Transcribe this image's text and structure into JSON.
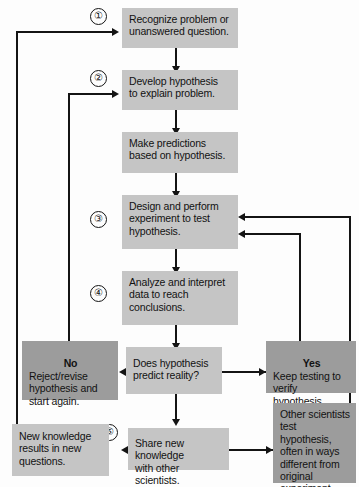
{
  "figure": {
    "kind": "flowchart",
    "colors": {
      "box_light": "#c5c5c5",
      "box_dark": "#9c9c9c",
      "line": "#141414",
      "text": "#121212",
      "background": "#fdfdfd"
    }
  },
  "steps": {
    "one": "①",
    "two": "②",
    "three": "③",
    "four": "④",
    "five": "⑤"
  },
  "nodes": {
    "recognize": "Recognize problem or\nunanswered question.",
    "hypothesis": "Develop hypothesis\nto explain problem.",
    "predictions": "Make predictions\nbased on hypothesis.",
    "experiment": "Design and perform\nexperiment to test\nhypothesis.",
    "analyze": "Analyze and interpret\ndata to reach\nconclusions.",
    "decision": "Does hypothesis\npredict reality?",
    "no_header": "No",
    "no_body": "Reject/revise\nhypothesis and\nstart again.",
    "yes_header": "Yes",
    "yes_body": "Keep testing to\nverify hypothesis.",
    "share": "Share new knowledge\nwith other scientists.",
    "new_knowledge": "New knowledge\nresults in new\nquestions.",
    "other_scientists": "Other scientists\ntest hypothesis,\noften in ways\ndifferent from\noriginal\nexperiment."
  }
}
